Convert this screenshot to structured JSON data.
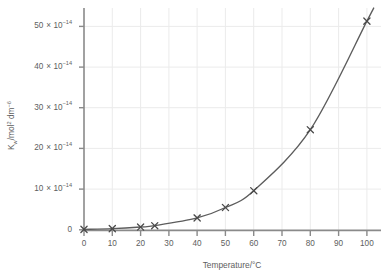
{
  "chart_data": {
    "type": "line",
    "title": "",
    "subtitle": "",
    "xlabel": "Temperature/°C",
    "ylabel": "Kᵥᵥ/mol² dm⁻⁶",
    "ylabel_parts": {
      "symbol": "K",
      "subscript": "w",
      "units_main": "/mol",
      "units_sup1": "2",
      "units_mid": " dm",
      "units_sup2": "−6"
    },
    "x": [
      0,
      10,
      20,
      25,
      40,
      50,
      60,
      80,
      100
    ],
    "y": [
      0.114,
      0.293,
      0.681,
      1.008,
      2.92,
      5.48,
      9.61,
      24.6,
      51.3
    ],
    "y_scale_exponent": "-14",
    "y_scale_note": "values in units of 10^-14 mol^2 dm^-6",
    "xlim": [
      0,
      105
    ],
    "ylim": [
      0,
      55
    ],
    "xticks": [
      0,
      10,
      20,
      30,
      40,
      50,
      60,
      70,
      80,
      90,
      100
    ],
    "xtick_labels": [
      "0",
      "10",
      "20",
      "30",
      "40",
      "50",
      "60",
      "70",
      "80",
      "90",
      "100"
    ],
    "yticks": [
      0,
      10,
      20,
      30,
      40,
      50
    ],
    "ytick_labels": [
      "0",
      "10",
      "20",
      "30",
      "40",
      "50"
    ],
    "ytick_mantissas": [
      "0",
      "10",
      "20",
      "30",
      "40",
      "50"
    ],
    "ytick_multiplier": "× 10",
    "ytick_exponent": "−14",
    "grid": true,
    "grid_x": true,
    "grid_y": true,
    "legend": false,
    "legend_position": "none",
    "marker": "x-cross",
    "marker_count": 9,
    "series": [
      {
        "name": "Kw vs temperature",
        "values": [
          0.114,
          0.293,
          0.681,
          1.008,
          2.92,
          5.48,
          9.61,
          24.6,
          51.3
        ]
      }
    ],
    "annotations": []
  },
  "style": {
    "background": "#ffffff",
    "curve_color": "#5c5c5c",
    "marker_color": "#4a4a4a",
    "axis_color": "#8a8a8a",
    "grid_color": "#ebebeb",
    "text_color": "#5e5e5e"
  },
  "axis_origin_label": "0"
}
